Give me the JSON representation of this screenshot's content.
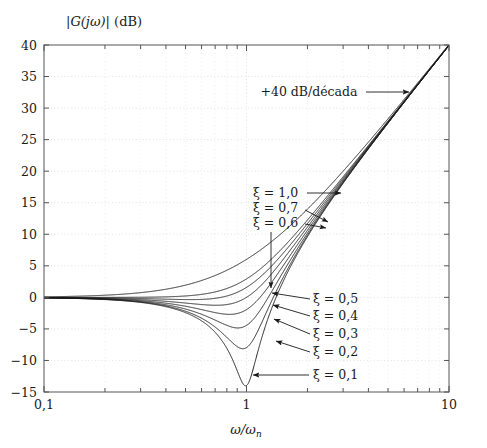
{
  "figure": {
    "y_axis_title": "|G(jω)| (dB)",
    "x_axis_title": "ω/ωn",
    "background_color": "#ffffff",
    "curve_color": "#1a1a1a",
    "grid_color": "#d8d8d8",
    "axis_color": "#555555"
  },
  "axes": {
    "y_tick_labels": [
      "40",
      "35",
      "30",
      "25",
      "20",
      "15",
      "10",
      "5",
      "0",
      "-5",
      "-10",
      "-15"
    ],
    "x_tick_labels": [
      "0,1",
      "1",
      "10"
    ]
  },
  "annotations": {
    "slope": "+40 dB/década",
    "zeta_1_0": "ξ = 1,0",
    "zeta_0_7": "ξ = 0,7",
    "zeta_0_6": "ξ = 0,6",
    "zeta_0_5": "ξ = 0,5",
    "zeta_0_4": "ξ = 0,4",
    "zeta_0_3": "ξ = 0,3",
    "zeta_0_2": "ξ = 0,2",
    "zeta_0_1": "ξ = 0,1"
  },
  "chart_data": {
    "type": "line",
    "title": "|G(jω)| (dB)",
    "xlabel": "ω/ωn",
    "ylabel": "|G(jω)| (dB)",
    "xscale": "log",
    "xlim": [
      0.1,
      10
    ],
    "ylim": [
      -15,
      40
    ],
    "yticks": [
      -15,
      -10,
      -5,
      0,
      5,
      10,
      15,
      20,
      25,
      30,
      35,
      40
    ],
    "xticks": [
      0.1,
      1,
      10
    ],
    "grid": true,
    "legend": "inline-annotations",
    "asymptote_slope_db_per_decade": 40,
    "series": [
      {
        "name": "ξ = 0,1",
        "zeta": 0.1,
        "peak_db": -14.0,
        "peak_at_u": 1.0,
        "value_at_u_10_db": 40.0,
        "value_at_u_0_1_db": 0.09
      },
      {
        "name": "ξ = 0,2",
        "zeta": 0.2,
        "peak_db": -8.1,
        "peak_at_u": 1.0,
        "value_at_u_10_db": 40.0,
        "value_at_u_0_1_db": 0.09
      },
      {
        "name": "ξ = 0,3",
        "zeta": 0.3,
        "peak_db": -4.8,
        "peak_at_u": 1.0,
        "value_at_u_10_db": 40.0,
        "value_at_u_0_1_db": 0.09
      },
      {
        "name": "ξ = 0,4",
        "zeta": 0.4,
        "peak_db": -2.7,
        "peak_at_u": 1.0,
        "value_at_u_10_db": 40.0,
        "value_at_u_0_1_db": 0.09
      },
      {
        "name": "ξ = 0,5",
        "zeta": 0.5,
        "peak_db": -1.2,
        "peak_at_u": 1.0,
        "value_at_u_10_db": 40.0,
        "value_at_u_0_1_db": 0.09
      },
      {
        "name": "ξ = 0,6",
        "zeta": 0.6,
        "peak_db": -0.3,
        "peak_at_u": 1.0,
        "value_at_u_10_db": 40.0,
        "value_at_u_0_1_db": 0.09
      },
      {
        "name": "ξ = 0,7",
        "zeta": 0.7,
        "peak_db": 0.9,
        "peak_at_u": 1.0,
        "value_at_u_10_db": 40.0,
        "value_at_u_0_1_db": 0.09
      },
      {
        "name": "ξ = 1,0",
        "zeta": 1.0,
        "peak_db": 6.0,
        "peak_at_u": 1.0,
        "value_at_u_10_db": 40.0,
        "value_at_u_0_1_db": 0.09
      }
    ]
  }
}
